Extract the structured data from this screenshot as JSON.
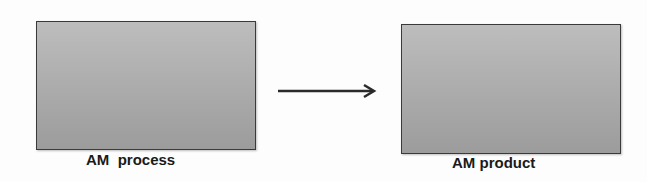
{
  "diagram": {
    "nodes": [
      {
        "id": "process",
        "label": "AM  process"
      },
      {
        "id": "product",
        "label": "AM product"
      }
    ],
    "edges": [
      {
        "from": "process",
        "to": "product",
        "style": "arrow"
      }
    ],
    "colors": {
      "box_fill": "#aaaaaa",
      "box_border": "#3a3a3a",
      "arrow": "#2a2a2a",
      "text": "#1a1a1a"
    }
  }
}
